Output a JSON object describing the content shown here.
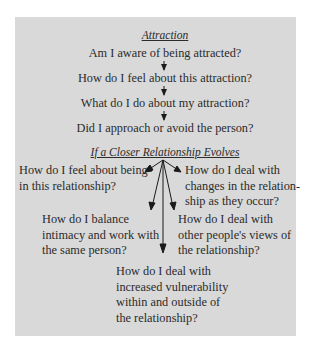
{
  "diagram": {
    "section1": {
      "title": "Attraction",
      "steps": [
        "Am I aware of being attracted?",
        "How do I feel about this attraction?",
        "What do I do about my attraction?",
        "Did I approach or avoid the person?"
      ]
    },
    "section2": {
      "title": "If a Closer Relationship Evolves",
      "branches": [
        {
          "lines": [
            "How do I feel about being",
            "in this relationship?"
          ]
        },
        {
          "lines": [
            "How do I deal with",
            "changes in the relation-",
            "ship as they occur?"
          ]
        },
        {
          "lines": [
            "How do I balance",
            "intimacy and work with",
            "the same person?"
          ]
        },
        {
          "lines": [
            "How do I deal with",
            "other people's views of",
            "the relationship?"
          ]
        },
        {
          "lines": [
            "How do I deal with",
            "increased vulnerability",
            "within and outside of",
            "the relationship?"
          ]
        }
      ]
    },
    "colors": {
      "panel_bg": "#d9d9d9",
      "text": "#2b2b2b",
      "arrow": "#1a1a1a"
    }
  }
}
